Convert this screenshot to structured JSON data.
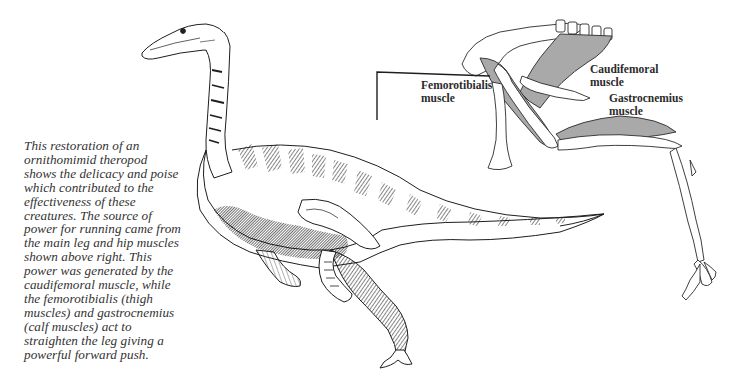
{
  "figure": {
    "caption_lines": [
      "This restoration of an",
      "ornithomimid theropod",
      "shows the delicacy and poise",
      "which contributed to the",
      "effectiveness of these",
      "creatures. The source of",
      "power for running came from",
      "the main leg and hip muscles",
      "shown above right. This",
      "power was generated by the",
      "caudifemoral muscle, while",
      "the femorotibialis (thigh",
      "muscles) and gastrocnemius",
      "(calf muscles) act to",
      "straighten the leg giving a",
      "powerful forward push."
    ],
    "diagram_labels": {
      "femorotibialis": [
        "Femorotibialis",
        "muscle"
      ],
      "caudifemoral": [
        "Caudifemoral",
        "muscle"
      ],
      "gastrocnemius": [
        "Gastrocnemius",
        "muscle"
      ]
    },
    "colors": {
      "ink": "#1e1e1e",
      "muscle_fill": "#a9a9a9",
      "background": "#ffffff",
      "text": "#333333"
    }
  }
}
